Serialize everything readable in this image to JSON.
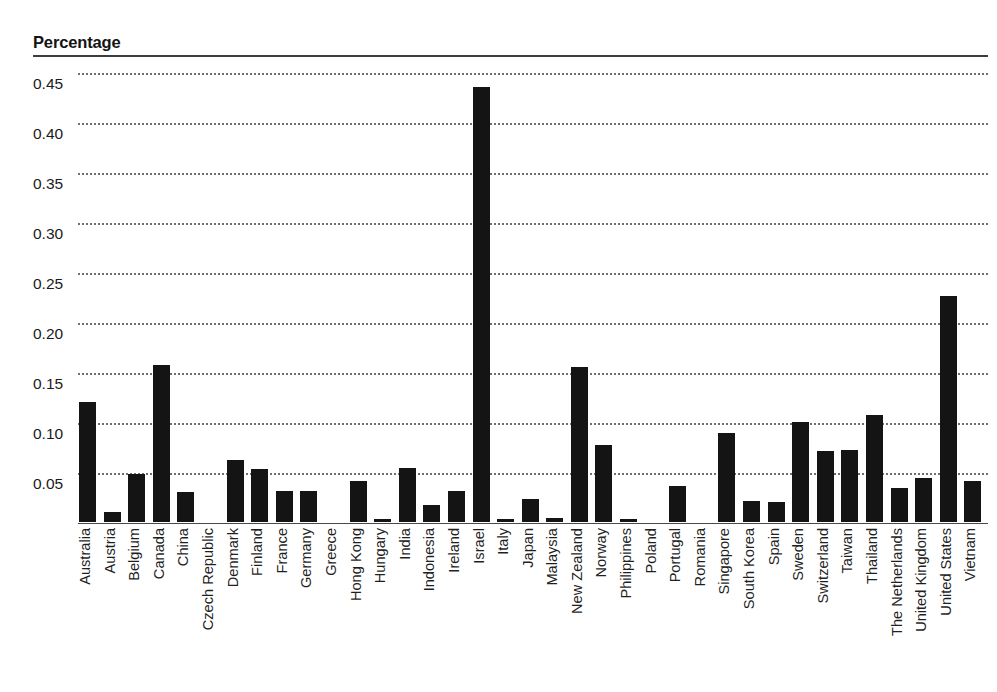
{
  "header": {
    "title": "Percentage"
  },
  "chart_data": {
    "type": "bar",
    "title": "Percentage",
    "xlabel": "",
    "ylabel": "Percentage",
    "ylim": [
      0,
      0.465
    ],
    "ytick_labels": [
      "0.45",
      "0.40",
      "0.35",
      "0.30",
      "0.25",
      "0.20",
      "0.15",
      "0.10",
      "0.05"
    ],
    "ytick_values": [
      0.45,
      0.4,
      0.35,
      0.3,
      0.25,
      0.2,
      0.15,
      0.1,
      0.05
    ],
    "grid": "horizontal-dotted",
    "legend": null,
    "bar_color": "#141414",
    "categories": [
      "Australia",
      "Austria",
      "Belgium",
      "Canada",
      "China",
      "Czech Republic",
      "Denmark",
      "Finland",
      "France",
      "Germany",
      "Greece",
      "Hong Kong",
      "Hungary",
      "India",
      "Indonesia",
      "Ireland",
      "Israel",
      "Italy",
      "Japan",
      "Malaysia",
      "New Zealand",
      "Norway",
      "Philippines",
      "Poland",
      "Portugal",
      "Romania",
      "Singapore",
      "South Korea",
      "Spain",
      "Sweden",
      "Switzerland",
      "Taiwan",
      "Thailand",
      "The Netherlands",
      "United Kingdom",
      "United States",
      "Vietnam"
    ],
    "values": [
      0.12,
      0.01,
      0.048,
      0.157,
      0.03,
      0.0,
      0.062,
      0.053,
      0.031,
      0.031,
      0.0,
      0.041,
      0.003,
      0.054,
      0.017,
      0.031,
      0.435,
      0.003,
      0.023,
      0.004,
      0.155,
      0.077,
      0.003,
      0.0,
      0.036,
      0.0,
      0.089,
      0.021,
      0.02,
      0.1,
      0.071,
      0.072,
      0.107,
      0.034,
      0.044,
      0.226,
      0.041
    ]
  }
}
